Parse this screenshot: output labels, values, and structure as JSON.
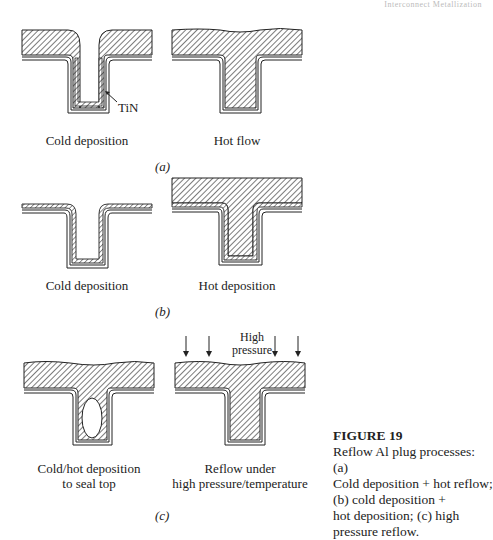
{
  "running_head": "Interconnect Metallization",
  "figure": {
    "number_label": "FIGURE 19",
    "caption": "Reflow Al plug processes: (a) Cold deposition + hot reflow; (b) cold deposition + hot deposition; (c) high pressure reflow.",
    "caption_lines": [
      "Reflow Al plug processes: (a)",
      "Cold deposition + hot reflow;",
      "(b) cold deposition +",
      "hot deposition; (c) high",
      "pressure reflow."
    ]
  },
  "panels": [
    {
      "id": "a",
      "label": "(a)",
      "left_label": "Cold deposition",
      "right_label": "Hot flow",
      "annotation": "TiN"
    },
    {
      "id": "b",
      "label": "(b)",
      "left_label": "Cold deposition",
      "right_label": "Hot deposition"
    },
    {
      "id": "c",
      "label": "(c)",
      "left_label_line1": "Cold/hot deposition",
      "left_label_line2": "to seal top",
      "right_label_line1": "Reflow under",
      "right_label_line2": "high pressure/temperature",
      "pressure_label_line1": "High",
      "pressure_label_line2": "pressure"
    }
  ],
  "colors": {
    "ink": "#222222",
    "hatch": "#444444",
    "background": "#ffffff"
  }
}
